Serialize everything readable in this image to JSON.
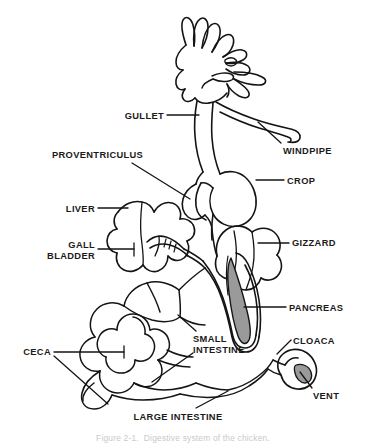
{
  "figure": {
    "style": "black-and-white line drawing",
    "background_color": "#ffffff",
    "line_color": "#141414",
    "shade_color": "#9a9a9a"
  },
  "labels": [
    {
      "key": "gullet",
      "text": "GULLET",
      "align": "right",
      "x": 106,
      "y": 111,
      "w": 58
    },
    {
      "key": "windpipe",
      "text": "WINDPIPE",
      "align": "left",
      "x": 283,
      "y": 146,
      "w": 80
    },
    {
      "key": "proventriculus",
      "text": "PROVENTRICULUS",
      "align": "left",
      "x": 52,
      "y": 150,
      "w": 106
    },
    {
      "key": "crop",
      "text": "CROP",
      "align": "left",
      "x": 287,
      "y": 176,
      "w": 52
    },
    {
      "key": "liver",
      "text": "LIVER",
      "align": "right",
      "x": 45,
      "y": 204,
      "w": 50
    },
    {
      "key": "gall_bladder",
      "text": "GALL\nBLADDER",
      "align": "right",
      "x": 28,
      "y": 240,
      "w": 67
    },
    {
      "key": "gizzard",
      "text": "GIZZARD",
      "align": "left",
      "x": 292,
      "y": 238,
      "w": 62
    },
    {
      "key": "pancreas",
      "text": "PANCREAS",
      "align": "left",
      "x": 289,
      "y": 303,
      "w": 68
    },
    {
      "key": "small_intestine",
      "text": "SMALL\nINTESTINE",
      "align": "left",
      "x": 193,
      "y": 334,
      "w": 72
    },
    {
      "key": "cloaca",
      "text": "CLOACA",
      "align": "left",
      "x": 293,
      "y": 336,
      "w": 56
    },
    {
      "key": "ceca",
      "text": "CECA",
      "align": "right",
      "x": 11,
      "y": 347,
      "w": 40
    },
    {
      "key": "vent",
      "text": "VENT",
      "align": "left",
      "x": 313,
      "y": 391,
      "w": 40
    },
    {
      "key": "large_intestine",
      "text": "LARGE INTESTINE",
      "align": "center",
      "x": 118,
      "y": 412,
      "w": 120
    }
  ],
  "caption": {
    "text": "Figure 2-1.  Digestive system of the chicken.",
    "x": 0,
    "y": 433,
    "clipped": true
  },
  "parts": [
    "gullet",
    "windpipe",
    "proventriculus",
    "crop",
    "liver",
    "gall bladder",
    "gizzard",
    "pancreas",
    "small intestine",
    "cloaca",
    "ceca",
    "vent",
    "large intestine"
  ]
}
